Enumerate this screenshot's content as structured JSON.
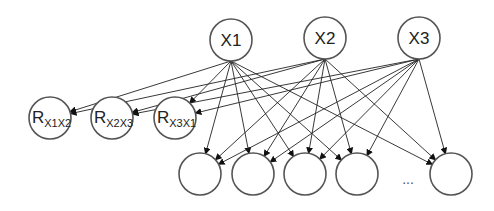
{
  "diagram": {
    "type": "neural-network-graph",
    "input_nodes": [
      {
        "id": "X1",
        "label": "X1",
        "cx": 231,
        "cy": 40
      },
      {
        "id": "X2",
        "label": "X2",
        "cx": 325,
        "cy": 38
      },
      {
        "id": "X3",
        "label": "X3",
        "cx": 419,
        "cy": 38
      }
    ],
    "relation_nodes": [
      {
        "id": "R12",
        "main": "R",
        "sub": "X1X2",
        "cx": 50,
        "cy": 118
      },
      {
        "id": "R23",
        "main": "R",
        "sub": "X2X3",
        "cx": 112,
        "cy": 118
      },
      {
        "id": "R31",
        "main": "R",
        "sub": "X3X1",
        "cx": 175,
        "cy": 118
      }
    ],
    "output_nodes": [
      {
        "id": "O1",
        "cx": 200,
        "cy": 174
      },
      {
        "id": "O2",
        "cx": 253,
        "cy": 174
      },
      {
        "id": "O3",
        "cx": 305,
        "cy": 174
      },
      {
        "id": "O4",
        "cx": 357,
        "cy": 174
      },
      {
        "id": "On",
        "cx": 451,
        "cy": 174
      }
    ],
    "ellipsis": "...",
    "edges_description": "Each X node connects to the relation nodes involving it and to every output node (directed arrows downward)."
  }
}
